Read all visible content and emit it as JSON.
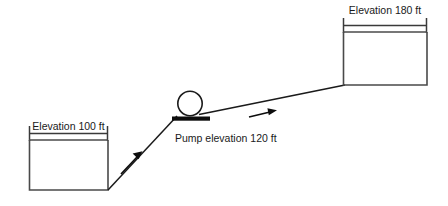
{
  "diagram": {
    "colors": {
      "background": "#ffffff",
      "line": "#1a1a1a",
      "tank_wall": "#4a4a4a",
      "fill_black": "#0d0d0d"
    },
    "labels": {
      "source_tank": "Elevation 100 ft",
      "pump": "Pump elevation 120 ft",
      "destination_tank": "Elevation 180 ft"
    },
    "elevations": {
      "source_tank_ft": 100,
      "pump_ft": 120,
      "destination_tank_ft": 180,
      "units": "ft"
    },
    "components": [
      {
        "name": "source-tank",
        "label": "Elevation 100 ft",
        "elevation_ft": 100
      },
      {
        "name": "pump",
        "label": "Pump elevation 120 ft",
        "elevation_ft": 120,
        "icon": "pump-circle-icon"
      },
      {
        "name": "destination-tank",
        "label": "Elevation 180 ft",
        "elevation_ft": 180
      }
    ],
    "flow_arrows": [
      {
        "name": "suction-flow-arrow",
        "direction": "up-right"
      },
      {
        "name": "discharge-flow-arrow",
        "direction": "right"
      }
    ]
  }
}
